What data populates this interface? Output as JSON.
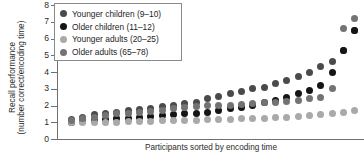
{
  "chart_data": {
    "type": "scatter",
    "title": "",
    "xlabel": "Participants sorted by encoding time",
    "ylabel": "Recall performance (number correct/encoding time)",
    "ylabel_line1": "Recall performance",
    "ylabel_line2": "(number correct/encoding time)",
    "ylim": [
      0,
      8
    ],
    "yticks": [
      0,
      1,
      2,
      3,
      4,
      5,
      6,
      7,
      8
    ],
    "ytick_labels": [
      "0",
      "1",
      "2",
      "3",
      "4",
      "5",
      "6",
      "7",
      "8"
    ],
    "xlim": [
      0,
      27
    ],
    "xticks": [],
    "xtick_labels": [],
    "grid": false,
    "legend_position": "top-left",
    "series": [
      {
        "name": "Younger children (9–10)",
        "color": "#4a4a4a",
        "x": [
          1,
          2,
          3,
          4,
          5,
          6,
          7,
          8,
          9,
          10,
          11,
          12,
          13,
          14,
          15,
          16,
          17,
          18,
          19,
          20,
          21,
          22,
          23,
          24,
          25,
          26
        ],
        "values": [
          1.15,
          1.3,
          1.45,
          1.5,
          1.6,
          1.7,
          1.75,
          1.85,
          1.95,
          2.0,
          2.1,
          2.2,
          2.4,
          2.55,
          2.7,
          2.85,
          3.0,
          3.1,
          3.3,
          3.5,
          3.75,
          4.0,
          4.3,
          4.6,
          5.3,
          6.5
        ]
      },
      {
        "name": "Older children (11–12)",
        "color": "#151515",
        "x": [
          1,
          2,
          3,
          4,
          5,
          6,
          7,
          8,
          9,
          10,
          11,
          12,
          13,
          14,
          15,
          16,
          17,
          18,
          19,
          20,
          21,
          22,
          23,
          24,
          25,
          26
        ],
        "values": [
          1.0,
          1.05,
          1.1,
          1.15,
          1.2,
          1.25,
          1.3,
          1.35,
          1.4,
          1.45,
          1.5,
          1.55,
          1.6,
          1.7,
          1.8,
          1.9,
          2.0,
          2.15,
          2.3,
          2.5,
          2.7,
          2.9,
          3.2,
          4.0,
          5.3,
          6.5
        ]
      },
      {
        "name": "Younger adults (20–25)",
        "color": "#a9a9a9",
        "x": [
          1,
          2,
          3,
          4,
          5,
          6,
          7,
          8,
          9,
          10,
          11,
          12,
          13,
          14,
          15,
          16,
          17,
          18,
          19,
          20,
          21,
          22,
          23,
          24,
          25,
          26
        ],
        "values": [
          1.0,
          1.0,
          1.0,
          1.0,
          1.0,
          1.02,
          1.05,
          1.05,
          1.08,
          1.1,
          1.1,
          1.12,
          1.15,
          1.15,
          1.18,
          1.2,
          1.22,
          1.25,
          1.28,
          1.3,
          1.35,
          1.4,
          1.45,
          1.5,
          1.6,
          1.7
        ]
      },
      {
        "name": "Older adults (65–78)",
        "color": "#737373",
        "x": [
          1,
          2,
          3,
          4,
          5,
          6,
          7,
          8,
          9,
          10,
          11,
          12,
          13,
          14,
          15,
          16,
          17,
          18,
          19,
          20,
          21,
          22,
          23,
          24,
          25,
          26
        ],
        "values": [
          1.1,
          1.2,
          1.3,
          1.4,
          1.5,
          1.55,
          1.6,
          1.65,
          1.7,
          1.8,
          1.9,
          1.95,
          2.0,
          2.0,
          2.0,
          2.05,
          2.1,
          2.15,
          2.2,
          2.25,
          2.3,
          2.4,
          2.5,
          3.0,
          6.6,
          7.2
        ]
      }
    ]
  }
}
